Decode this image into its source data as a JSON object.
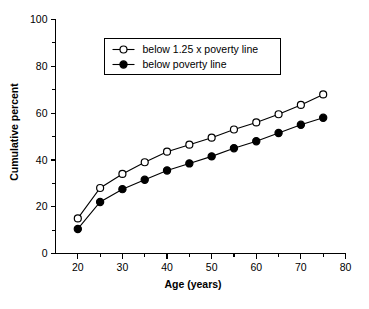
{
  "chart_data": {
    "type": "line",
    "title": "",
    "subtitle": "",
    "xlabel": "Age (years)",
    "ylabel": "Cumulative percent",
    "x": [
      20,
      25,
      30,
      35,
      40,
      45,
      50,
      55,
      60,
      65,
      70,
      75
    ],
    "xlim": [
      15,
      80
    ],
    "ylim": [
      0,
      100
    ],
    "grid": false,
    "legend_position": "top-center",
    "x_ticklabels": [
      "20",
      "30",
      "40",
      "50",
      "60",
      "70",
      "80"
    ],
    "x_majorticks": [
      20,
      30,
      40,
      50,
      60,
      70,
      80
    ],
    "x_minorticks": [
      25,
      35,
      45,
      55,
      65,
      75
    ],
    "y_ticklabels": [
      "0",
      "20",
      "40",
      "60",
      "80",
      "100"
    ],
    "y_majorticks": [
      0,
      20,
      40,
      60,
      80,
      100
    ],
    "y_minorticks": [
      10,
      30,
      50,
      70,
      90
    ],
    "series": [
      {
        "name": "below 1.25 x poverty line",
        "marker": "open-circle",
        "color": "#000000",
        "values": [
          15,
          28,
          34,
          39,
          43.5,
          46.5,
          49.5,
          53,
          56,
          59.5,
          63.5,
          68
        ]
      },
      {
        "name": "below poverty line",
        "marker": "filled-circle",
        "color": "#000000",
        "values": [
          10.5,
          22,
          27.5,
          31.5,
          35.5,
          38.5,
          41.5,
          45,
          48,
          51.5,
          55,
          58
        ]
      }
    ]
  },
  "legend": {
    "entries": [
      {
        "label": "below 1.25 x poverty line",
        "marker": "open-circle"
      },
      {
        "label": "below poverty line",
        "marker": "filled-circle"
      }
    ]
  },
  "axes": {
    "x_title": "Age (years)",
    "y_title": "Cumulative percent"
  },
  "colors": {
    "foreground": "#000000",
    "background": "#ffffff"
  }
}
